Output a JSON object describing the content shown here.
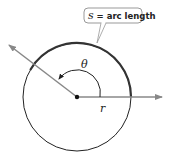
{
  "diagram": {
    "callout": {
      "text": "s = arc length",
      "var": "s",
      "rest": " = arc length"
    },
    "labels": {
      "angle": "θ",
      "radius": "r"
    },
    "colors": {
      "circle": "#222222",
      "arc": "#333333",
      "ray": "#888888",
      "callout_border": "#999999"
    }
  }
}
